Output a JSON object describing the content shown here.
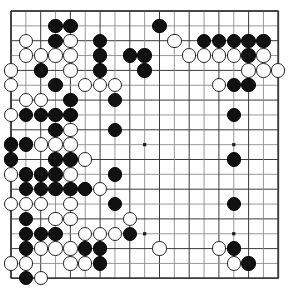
{
  "app": {
    "title": "Go Board Position",
    "board_size": 19,
    "colors": {
      "background": "#ffffff",
      "line": "#3a3a3a",
      "line_light": "#8d8d8d",
      "black_stone": "#111111",
      "white_stone": "#ffffff",
      "white_stone_border": "#222222",
      "star_point": "#1a1a1a"
    }
  },
  "board": {
    "size": 19,
    "origin_x": 11,
    "origin_y": 11,
    "spacing": 14.85,
    "stone_radius": 7.2,
    "star_points": [
      [
        3,
        3
      ],
      [
        9,
        3
      ],
      [
        15,
        3
      ],
      [
        3,
        9
      ],
      [
        9,
        9
      ],
      [
        15,
        9
      ],
      [
        3,
        15
      ],
      [
        9,
        15
      ],
      [
        15,
        15
      ]
    ],
    "black_stones": [
      [
        3,
        1
      ],
      [
        4,
        1
      ],
      [
        10,
        1
      ],
      [
        3,
        2
      ],
      [
        6,
        2
      ],
      [
        13,
        2
      ],
      [
        14,
        2
      ],
      [
        15,
        2
      ],
      [
        16,
        2
      ],
      [
        17,
        2
      ],
      [
        6,
        3
      ],
      [
        8,
        3
      ],
      [
        9,
        3
      ],
      [
        16,
        3
      ],
      [
        2,
        4
      ],
      [
        6,
        4
      ],
      [
        9,
        4
      ],
      [
        3,
        5
      ],
      [
        15,
        5
      ],
      [
        16,
        5
      ],
      [
        4,
        6
      ],
      [
        7,
        6
      ],
      [
        1,
        7
      ],
      [
        2,
        7
      ],
      [
        3,
        7
      ],
      [
        4,
        7
      ],
      [
        15,
        7
      ],
      [
        3,
        8
      ],
      [
        7,
        8
      ],
      [
        0,
        9
      ],
      [
        1,
        9
      ],
      [
        0,
        10
      ],
      [
        3,
        10
      ],
      [
        4,
        10
      ],
      [
        15,
        10
      ],
      [
        1,
        11
      ],
      [
        2,
        11
      ],
      [
        3,
        11
      ],
      [
        7,
        11
      ],
      [
        1,
        12
      ],
      [
        2,
        12
      ],
      [
        3,
        12
      ],
      [
        4,
        12
      ],
      [
        5,
        12
      ],
      [
        7,
        13
      ],
      [
        15,
        13
      ],
      [
        1,
        14
      ],
      [
        1,
        15
      ],
      [
        2,
        15
      ],
      [
        3,
        15
      ],
      [
        8,
        15
      ],
      [
        1,
        16
      ],
      [
        5,
        16
      ],
      [
        6,
        16
      ],
      [
        15,
        16
      ],
      [
        16,
        17
      ],
      [
        6,
        17
      ],
      [
        1,
        18
      ]
    ],
    "white_stones": [
      [
        1,
        2
      ],
      [
        4,
        2
      ],
      [
        11,
        2
      ],
      [
        1,
        3
      ],
      [
        2,
        3
      ],
      [
        3,
        3
      ],
      [
        4,
        3
      ],
      [
        12,
        3
      ],
      [
        13,
        3
      ],
      [
        14,
        3
      ],
      [
        15,
        3
      ],
      [
        17,
        3
      ],
      [
        0,
        4
      ],
      [
        4,
        4
      ],
      [
        16,
        4
      ],
      [
        17,
        4
      ],
      [
        18,
        4
      ],
      [
        0,
        5
      ],
      [
        5,
        5
      ],
      [
        6,
        5
      ],
      [
        7,
        5
      ],
      [
        14,
        5
      ],
      [
        1,
        6
      ],
      [
        2,
        6
      ],
      [
        0,
        7
      ],
      [
        4,
        8
      ],
      [
        2,
        9
      ],
      [
        3,
        9
      ],
      [
        4,
        9
      ],
      [
        5,
        10
      ],
      [
        0,
        11
      ],
      [
        4,
        11
      ],
      [
        5,
        12
      ],
      [
        6,
        12
      ],
      [
        0,
        13
      ],
      [
        1,
        13
      ],
      [
        2,
        13
      ],
      [
        4,
        13
      ],
      [
        3,
        14
      ],
      [
        4,
        14
      ],
      [
        8,
        14
      ],
      [
        5,
        15
      ],
      [
        6,
        15
      ],
      [
        7,
        15
      ],
      [
        2,
        16
      ],
      [
        3,
        16
      ],
      [
        4,
        16
      ],
      [
        10,
        16
      ],
      [
        14,
        16
      ],
      [
        15,
        17
      ],
      [
        0,
        17
      ],
      [
        1,
        17
      ],
      [
        4,
        17
      ],
      [
        5,
        17
      ],
      [
        2,
        18
      ]
    ]
  }
}
